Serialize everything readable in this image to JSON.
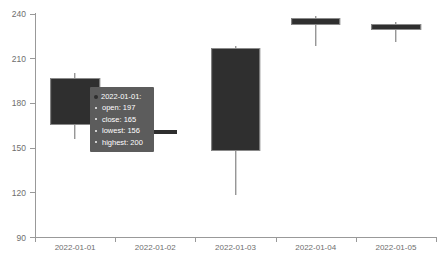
{
  "chart_data": {
    "type": "bar",
    "subtype": "candlestick",
    "title": "",
    "xlabel": "",
    "ylabel": "",
    "categories": [
      "2022-01-01",
      "2022-01-02",
      "2022-01-03",
      "2022-01-04",
      "2022-01-05"
    ],
    "ylim": [
      90,
      240
    ],
    "yticks": [
      240,
      210,
      180,
      150,
      120,
      90
    ],
    "grid": false,
    "legend": "none",
    "series": [
      {
        "name": "OHLC",
        "points": [
          {
            "date": "2022-01-01",
            "open": 197,
            "close": 165,
            "lowest": 156,
            "highest": 200
          },
          {
            "date": "2022-01-02",
            "open": null,
            "close": null,
            "lowest": null,
            "highest": null
          },
          {
            "date": "2022-01-03",
            "open": 217,
            "close": 148,
            "lowest": 118,
            "highest": 218
          },
          {
            "date": "2022-01-04",
            "open": 237,
            "close": 232,
            "lowest": 218,
            "highest": 238
          },
          {
            "date": "2022-01-05",
            "open": 233,
            "close": 229,
            "lowest": 221,
            "highest": 234
          }
        ]
      }
    ]
  },
  "axes": {
    "y_tick_labels": [
      "240",
      "210",
      "180",
      "150",
      "120",
      "90"
    ],
    "x_tick_labels": [
      "2022-01-01",
      "2022-01-02",
      "2022-01-03",
      "2022-01-04",
      "2022-01-05"
    ]
  },
  "tooltip": {
    "title": "2022-01-01:",
    "rows": [
      "open: 197",
      "close: 165",
      "lowest: 156",
      "highest: 200"
    ]
  },
  "colors": {
    "candle_body": "#2f2f2f",
    "candle_border": "#8a8a8a",
    "wick": "#6b6b6b",
    "axis": "#999999",
    "tick_text": "#6e6e6e",
    "tooltip_bg": "#5c5c5c",
    "tooltip_text": "#ffffff",
    "background": "#ffffff"
  }
}
